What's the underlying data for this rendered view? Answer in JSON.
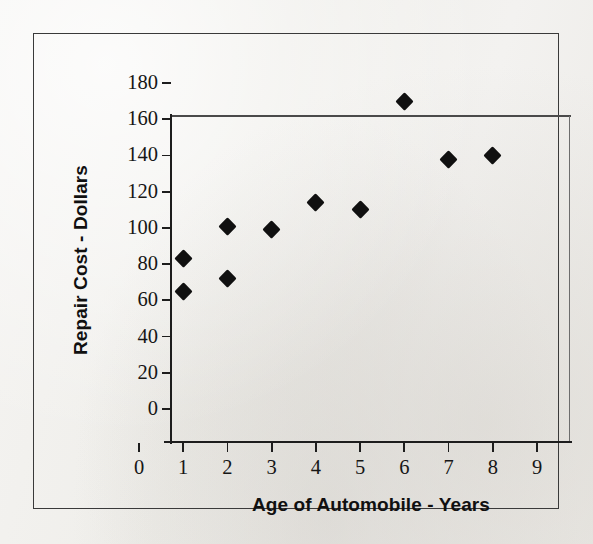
{
  "chart_data": {
    "type": "scatter",
    "title": "",
    "xlabel": "Age of Automobile - Years",
    "ylabel": "Repair Cost - Dollars",
    "xlim": [
      0,
      9
    ],
    "ylim": [
      0,
      180
    ],
    "xticks": [
      0,
      1,
      2,
      3,
      4,
      5,
      6,
      7,
      8,
      9
    ],
    "yticks": [
      0,
      20,
      40,
      60,
      80,
      100,
      120,
      140,
      160,
      180
    ],
    "xtick_labels": [
      "0",
      "1",
      "2",
      "3",
      "4",
      "5",
      "6",
      "7",
      "8",
      "9"
    ],
    "ytick_labels": [
      "0",
      "20",
      "40",
      "60",
      "80",
      "100",
      "120",
      "140",
      "160",
      "180"
    ],
    "grid": false,
    "legend": false,
    "marker": "filled-diamond",
    "marker_color": "#101010",
    "points": [
      {
        "x": 1,
        "y": 83
      },
      {
        "x": 1,
        "y": 65
      },
      {
        "x": 2,
        "y": 101
      },
      {
        "x": 2,
        "y": 72
      },
      {
        "x": 3,
        "y": 99
      },
      {
        "x": 4,
        "y": 114
      },
      {
        "x": 5,
        "y": 110
      },
      {
        "x": 6,
        "y": 170
      },
      {
        "x": 7,
        "y": 138
      },
      {
        "x": 8,
        "y": 140
      }
    ],
    "series": [
      {
        "name": "Repair cost vs age",
        "x": [
          1,
          1,
          2,
          2,
          3,
          4,
          5,
          6,
          7,
          8
        ],
        "values": [
          83,
          65,
          101,
          72,
          99,
          114,
          110,
          170,
          138,
          140
        ]
      }
    ]
  },
  "figure": {
    "background_color": "#f2f1ef",
    "frame_color": "#3a3a3a",
    "axis_color": "#1d1d1d"
  }
}
